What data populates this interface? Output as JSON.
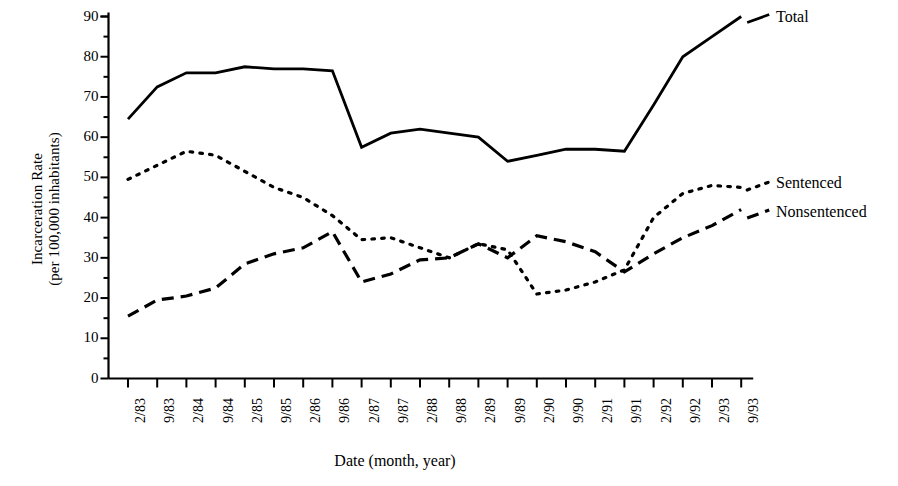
{
  "chart_data": {
    "type": "line",
    "title": "",
    "xlabel": "Date (month, year)",
    "ylabel": "Incarceration Rate (per 100,000 inhabitants)",
    "ylabel_line1": "Incarceration Rate",
    "ylabel_line2": "(per 100,000 inhabitants)",
    "ylim": [
      0,
      90
    ],
    "ytick_step": 10,
    "yminor_step": 5,
    "grid": false,
    "legend_position": "right-of-plot-inline",
    "yticks": [
      "90",
      "80",
      "70",
      "60",
      "50",
      "40",
      "30",
      "20",
      "10",
      "0"
    ],
    "ytick_values": [
      90,
      80,
      70,
      60,
      50,
      40,
      30,
      20,
      10,
      0
    ],
    "categories": [
      "2/83",
      "9/83",
      "2/84",
      "9/84",
      "2/85",
      "9/85",
      "2/86",
      "9/86",
      "2/87",
      "9/87",
      "2/88",
      "9/88",
      "2/89",
      "9/89",
      "2/90",
      "9/90",
      "2/91",
      "9/91",
      "2/92",
      "9/92",
      "2/93",
      "9/93"
    ],
    "series": [
      {
        "name": "Total",
        "style": "solid",
        "color": "#000000",
        "values": [
          64.5,
          72.5,
          76,
          76,
          77.5,
          77,
          77,
          76.5,
          57.5,
          61,
          62,
          61,
          60,
          54,
          55.5,
          57,
          57,
          56.5,
          68,
          80,
          85,
          90
        ]
      },
      {
        "name": "Sentenced",
        "style": "dotted",
        "color": "#000000",
        "values": [
          49.5,
          53,
          56.5,
          55.5,
          51.5,
          47.5,
          45,
          40.5,
          34.5,
          35,
          32.5,
          30,
          33.5,
          32,
          21,
          22,
          24,
          27,
          40,
          46,
          48,
          47.5
        ]
      },
      {
        "name": "Nonsentenced",
        "style": "dashed",
        "color": "#000000",
        "values": [
          15.5,
          19.5,
          20.5,
          22.5,
          28.5,
          31,
          32.5,
          36.5,
          24,
          26,
          29.5,
          30,
          33.5,
          30,
          35.5,
          34,
          31.5,
          26.5,
          31,
          35,
          38,
          42
        ]
      }
    ]
  },
  "labels": {
    "total": "Total",
    "sentenced": "Sentenced",
    "nonsentenced": "Nonsentenced"
  }
}
